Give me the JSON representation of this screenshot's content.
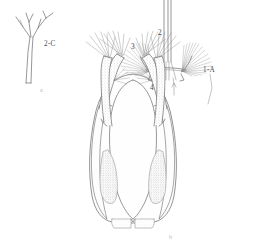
{
  "figure": {
    "type": "scientific-line-drawing",
    "background_color": "#ffffff",
    "ink_color": "#6b6b6b",
    "width": 266,
    "height": 244,
    "panels": [
      {
        "id": "a",
        "letter": "a",
        "name": "branched-seta-detail",
        "description": "branched seta with dichotomous tips",
        "labels": [
          {
            "id": "seta-label",
            "text": "2-C",
            "x": 44,
            "y": 44
          }
        ]
      },
      {
        "id": "b",
        "letter": "b",
        "name": "head-ventral-view",
        "description": "ventral view of head capsule with paired mouth brushes and antennae",
        "labels": [
          {
            "id": "label-2",
            "text": "2",
            "x": 160,
            "y": 33
          },
          {
            "id": "label-3",
            "text": "3",
            "x": 134,
            "y": 46
          },
          {
            "id": "label-1a",
            "text": "1-A",
            "x": 205,
            "y": 69
          },
          {
            "id": "label-4",
            "text": "4",
            "x": 153,
            "y": 86
          }
        ]
      }
    ],
    "panel_letters": [
      {
        "text": "a",
        "x": 41,
        "y": 90
      },
      {
        "text": "b",
        "x": 170,
        "y": 237
      }
    ]
  }
}
